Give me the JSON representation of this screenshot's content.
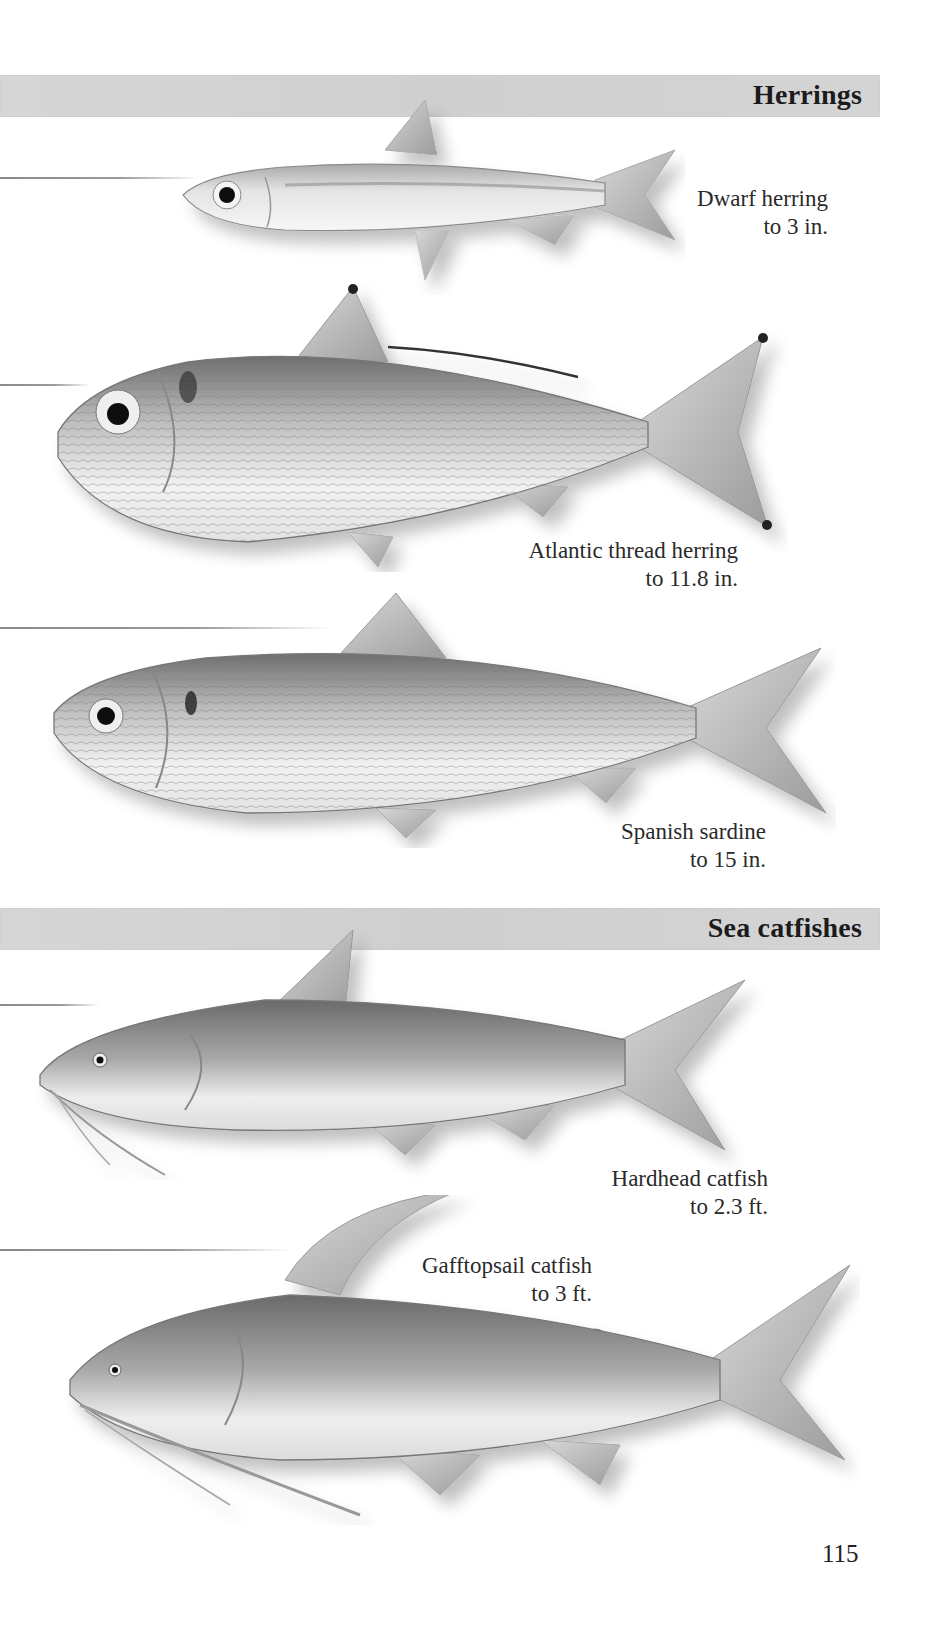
{
  "page": {
    "page_number": "115",
    "colors": {
      "band": "#d2d2d2",
      "text": "#222222",
      "fish_shade": "#8c8c8c"
    }
  },
  "sections": [
    {
      "title": "Herrings",
      "species": [
        {
          "name": "Dwarf herring",
          "size": "to 3 in."
        },
        {
          "name": "Atlantic thread herring",
          "size": "to 11.8 in."
        },
        {
          "name": "Spanish sardine",
          "size": "to 15 in."
        }
      ]
    },
    {
      "title": "Sea catfishes",
      "species": [
        {
          "name": "Hardhead catfish",
          "size": "to 2.3 ft."
        },
        {
          "name": "Gafftopsail catfish",
          "size": "to 3 ft."
        }
      ]
    }
  ]
}
